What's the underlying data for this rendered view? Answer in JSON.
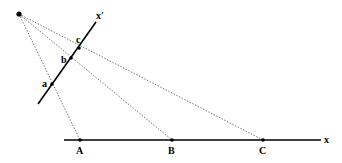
{
  "diagram": {
    "colors": {
      "line": "#000000",
      "dotted": "#555555",
      "background": "#ffffff"
    },
    "center_point": {
      "x": 19,
      "y": 14
    },
    "line_x": {
      "label": "x",
      "x1": 64,
      "y1": 140,
      "x2": 321,
      "y2": 140
    },
    "line_x_prime": {
      "label": "x′",
      "x1": 38,
      "y1": 104,
      "x2": 96,
      "y2": 22
    },
    "points_on_x": [
      {
        "label": "A",
        "x": 80,
        "y": 140
      },
      {
        "label": "B",
        "x": 172,
        "y": 140
      },
      {
        "label": "C",
        "x": 263,
        "y": 140
      }
    ],
    "points_on_x_prime": [
      {
        "label": "a",
        "x": 52,
        "y": 84
      },
      {
        "label": "b",
        "x": 71,
        "y": 58
      },
      {
        "label": "c",
        "x": 79,
        "y": 48
      }
    ]
  }
}
